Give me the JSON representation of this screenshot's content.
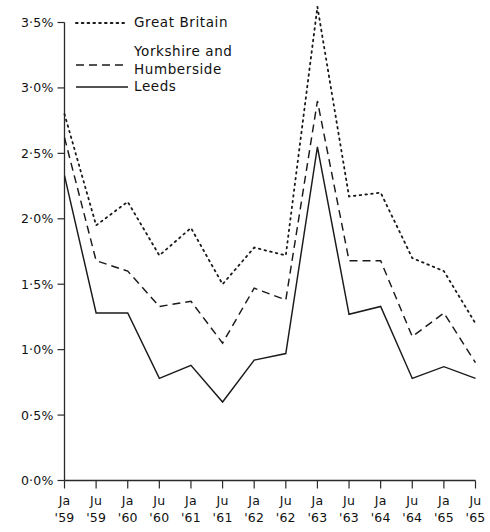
{
  "chart_data": {
    "type": "line",
    "title": "",
    "subtitle": "",
    "xlabel": "",
    "ylabel": "",
    "grid": false,
    "legend_position": "top-left",
    "ylim": [
      0.0,
      3.5
    ],
    "ytick_values": [
      0.0,
      0.5,
      1.0,
      1.5,
      2.0,
      2.5,
      3.0,
      3.5
    ],
    "ytick_labels": [
      "0·0%",
      "0·5%",
      "1·0%",
      "1·5%",
      "2·0%",
      "2·5%",
      "3·0%",
      "3·5%"
    ],
    "categories": [
      "Ja '59",
      "Ju '59",
      "Ja '60",
      "Ju '60",
      "Ja '61",
      "Ju '61",
      "Ja '62",
      "Ju '62",
      "Ja '63",
      "Ju '63",
      "Ja '64",
      "Ju '64",
      "Ja '65",
      "Ju '65"
    ],
    "xtick_labels_top": [
      "Ja",
      "Ju",
      "Ja",
      "Ju",
      "Ja",
      "Ju",
      "Ja",
      "Ju",
      "Ja",
      "Ju",
      "Ja",
      "Ju",
      "Ja",
      "Ju"
    ],
    "xtick_labels_bottom": [
      "'59",
      "'59",
      "'60",
      "'60",
      "'61",
      "'61",
      "'62",
      "'62",
      "'63",
      "'63",
      "'64",
      "'64",
      "'65",
      "'65"
    ],
    "series": [
      {
        "name": "Great Britain",
        "style": "dotted",
        "color": "#1a1a1a",
        "values": [
          2.8,
          1.95,
          2.13,
          1.72,
          1.93,
          1.5,
          1.78,
          1.72,
          3.62,
          2.17,
          2.2,
          1.7,
          1.6,
          1.2
        ]
      },
      {
        "name": "Yorkshire and Humberside",
        "style": "dashed",
        "color": "#1a1a1a",
        "values": [
          2.62,
          1.68,
          1.6,
          1.33,
          1.37,
          1.05,
          1.47,
          1.38,
          2.9,
          1.68,
          1.68,
          1.1,
          1.28,
          0.9
        ]
      },
      {
        "name": "Leeds",
        "style": "solid",
        "color": "#1a1a1a",
        "values": [
          2.33,
          1.28,
          1.28,
          0.78,
          0.88,
          0.6,
          0.92,
          0.97,
          2.55,
          1.27,
          1.33,
          0.78,
          0.87,
          0.78
        ]
      }
    ]
  },
  "legend": {
    "entries": [
      {
        "label": "Great Britain",
        "style": "dotted"
      },
      {
        "label": "Yorkshire and\nHumberside",
        "style": "dashed"
      },
      {
        "label": "Leeds",
        "style": "solid"
      }
    ],
    "great_britain_label": "Great Britain",
    "yorkshire_label_line1": "Yorkshire and",
    "yorkshire_label_line2": "Humberside",
    "leeds_label": "Leeds"
  }
}
